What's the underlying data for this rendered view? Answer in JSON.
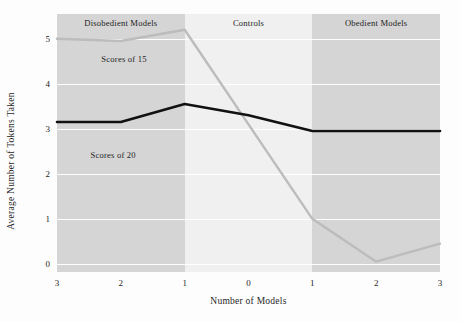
{
  "chart_data": {
    "type": "line",
    "title": "",
    "xlabel": "Number of Models",
    "ylabel": "Average Number of Tokens Taken",
    "xtick_labels": [
      "3",
      "2",
      "1",
      "0",
      "1",
      "2",
      "3"
    ],
    "ytick_labels": [
      "0",
      "1",
      "2",
      "3",
      "4",
      "5"
    ],
    "ylim": [
      -0.18,
      5.55
    ],
    "xlim": [
      0,
      6
    ],
    "grid": "horizontal-white",
    "legend": "inline-labels",
    "x": [
      0,
      1,
      2,
      3,
      4,
      5,
      6
    ],
    "series": [
      {
        "name": "Scores of 15",
        "color": "#bcbcbc",
        "values": [
          5.0,
          4.95,
          5.2,
          3.1,
          1.0,
          0.05,
          0.45
        ],
        "label_x": 1.05,
        "label_y": 4.55
      },
      {
        "name": "Scores of 20",
        "color": "#111111",
        "values": [
          3.15,
          3.15,
          3.55,
          3.3,
          2.95,
          2.95,
          2.95
        ],
        "label_x": 0.88,
        "label_y": 2.42
      }
    ],
    "bands": [
      {
        "label": "Disobedient Models",
        "x_start": 0,
        "x_end": 2,
        "shade": "shaded"
      },
      {
        "label": "Controls",
        "x_start": 2,
        "x_end": 4,
        "shade": "light"
      },
      {
        "label": "Obedient Models",
        "x_start": 4,
        "x_end": 6,
        "shade": "shaded"
      }
    ]
  }
}
